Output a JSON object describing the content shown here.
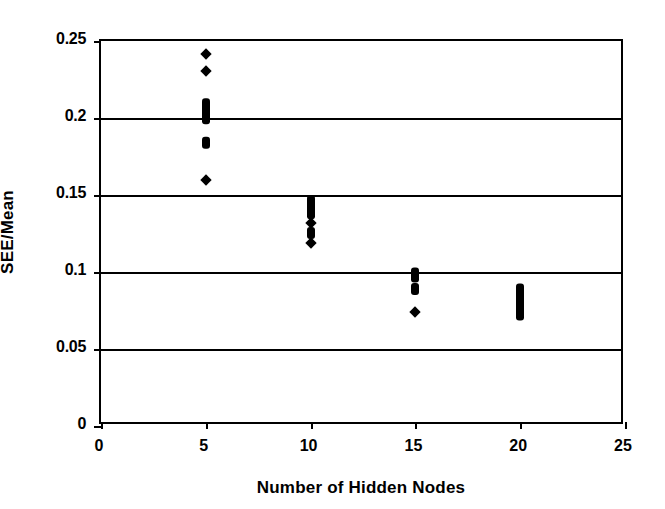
{
  "chart_data": {
    "type": "scatter",
    "title": "",
    "xlabel": "Number of Hidden Nodes",
    "ylabel": "SEE/Mean",
    "xlim": [
      0,
      25
    ],
    "ylim": [
      0,
      0.25
    ],
    "xticks": [
      "0",
      "5",
      "10",
      "15",
      "20",
      "25"
    ],
    "xtick_values": [
      0,
      5,
      10,
      15,
      20,
      25
    ],
    "yticks": [
      "0",
      "0.05",
      "0.1",
      "0.15",
      "0.2",
      "0.25"
    ],
    "ytick_values": [
      0,
      0.05,
      0.1,
      0.15,
      0.2,
      0.25
    ],
    "grid": "horizontal",
    "legend": "none",
    "marker": "filled-diamond",
    "marker_color": "#000000",
    "series": [
      {
        "name": "SEE/Mean",
        "points": [
          {
            "x": 5,
            "y": 0.2415
          },
          {
            "x": 5,
            "y": 0.2305
          },
          {
            "x": 5,
            "y": 0.21
          },
          {
            "x": 5,
            "y": 0.2055
          },
          {
            "x": 5,
            "y": 0.2015
          },
          {
            "x": 5,
            "y": 0.1985
          },
          {
            "x": 5,
            "y": 0.1855
          },
          {
            "x": 5,
            "y": 0.1825
          },
          {
            "x": 5,
            "y": 0.16
          },
          {
            "x": 10,
            "y": 0.147
          },
          {
            "x": 10,
            "y": 0.1445
          },
          {
            "x": 10,
            "y": 0.1405
          },
          {
            "x": 10,
            "y": 0.137
          },
          {
            "x": 10,
            "y": 0.132
          },
          {
            "x": 10,
            "y": 0.1265
          },
          {
            "x": 10,
            "y": 0.124
          },
          {
            "x": 10,
            "y": 0.119
          },
          {
            "x": 15,
            "y": 0.1
          },
          {
            "x": 15,
            "y": 0.0975
          },
          {
            "x": 15,
            "y": 0.0955
          },
          {
            "x": 15,
            "y": 0.09
          },
          {
            "x": 15,
            "y": 0.0875
          },
          {
            "x": 15,
            "y": 0.074
          },
          {
            "x": 20,
            "y": 0.09
          },
          {
            "x": 20,
            "y": 0.087
          },
          {
            "x": 20,
            "y": 0.0845
          },
          {
            "x": 20,
            "y": 0.08
          },
          {
            "x": 20,
            "y": 0.0755
          },
          {
            "x": 20,
            "y": 0.073
          },
          {
            "x": 20,
            "y": 0.071
          }
        ]
      }
    ]
  }
}
